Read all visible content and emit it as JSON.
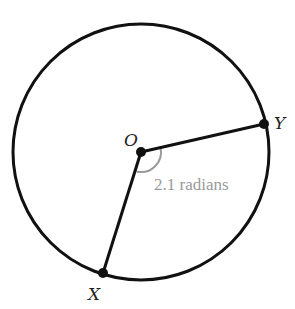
{
  "diagram": {
    "type": "circle-sector",
    "circle": {
      "cx": 141,
      "cy": 152,
      "r": 128,
      "stroke": "#111111"
    },
    "center": {
      "label": "O",
      "x": 141,
      "y": 152
    },
    "points": [
      {
        "label": "Y",
        "x": 264,
        "y": 124
      },
      {
        "label": "X",
        "x": 103,
        "y": 273
      }
    ],
    "angle": {
      "text": "2.1 radians",
      "color": "#9a9a9a"
    }
  }
}
